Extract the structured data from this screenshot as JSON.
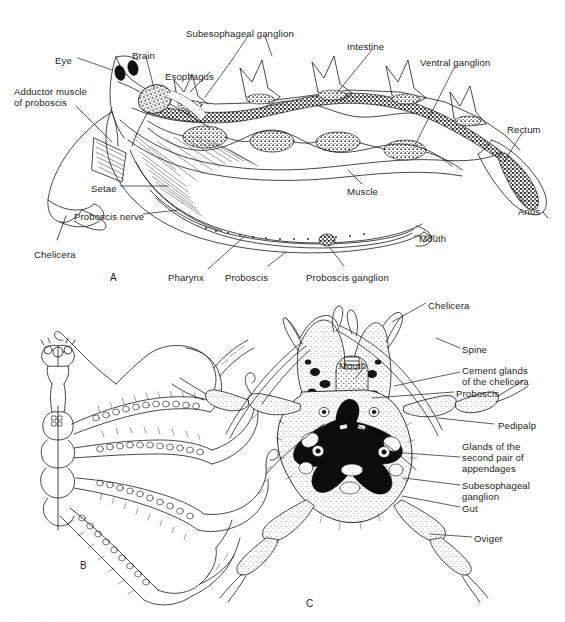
{
  "figure": {
    "background_color": "#ffffff",
    "ink_color": "#1a1a1a",
    "panel_letters": [
      {
        "id": "A",
        "label": "A",
        "x": 110,
        "y": 272
      },
      {
        "id": "B",
        "label": "B",
        "x": 80,
        "y": 560
      },
      {
        "id": "C",
        "label": "C",
        "x": 306,
        "y": 598
      }
    ],
    "bottom_cut_text": "....   ...    ......   ..........."
  },
  "panel_a": {
    "caption": "A",
    "description": "Lateral view, internal anatomy of the body and proboscis",
    "labels": [
      {
        "name": "eye",
        "text": "Eye",
        "x": 55,
        "y": 55,
        "align": "left"
      },
      {
        "name": "brain",
        "text": "Brain",
        "x": 132,
        "y": 50,
        "align": "left"
      },
      {
        "name": "subesophageal-ganglion",
        "text": "Subesophageal ganglion",
        "x": 186,
        "y": 28,
        "align": "left"
      },
      {
        "name": "intestine",
        "text": "Intestine",
        "x": 347,
        "y": 41,
        "align": "left"
      },
      {
        "name": "ventral-ganglion",
        "text": "Ventral ganglion",
        "x": 420,
        "y": 57,
        "align": "left"
      },
      {
        "name": "esophagus",
        "text": "Esophagus",
        "x": 165,
        "y": 71,
        "align": "left"
      },
      {
        "name": "adductor-muscle-of-proboscis",
        "text": "Adductor muscle\nof proboscis",
        "x": 14,
        "y": 86,
        "align": "left"
      },
      {
        "name": "rectum",
        "text": "Rectum",
        "x": 507,
        "y": 124,
        "align": "left"
      },
      {
        "name": "anus",
        "text": "Anus",
        "x": 518,
        "y": 206,
        "align": "left"
      },
      {
        "name": "muscle",
        "text": "Muscle",
        "x": 347,
        "y": 186,
        "align": "left"
      },
      {
        "name": "setae",
        "text": "Setae",
        "x": 91,
        "y": 183,
        "align": "left"
      },
      {
        "name": "proboscis-nerve",
        "text": "Proboscis nerve",
        "x": 74,
        "y": 211,
        "align": "left"
      },
      {
        "name": "chelicera",
        "text": "Chelicera",
        "x": 34,
        "y": 249,
        "align": "left"
      },
      {
        "name": "pharynx",
        "text": "Pharynx",
        "x": 168,
        "y": 272,
        "align": "left"
      },
      {
        "name": "proboscis",
        "text": "Proboscis",
        "x": 225,
        "y": 272,
        "align": "left"
      },
      {
        "name": "proboscis-ganglion",
        "text": "Proboscis ganglion",
        "x": 306,
        "y": 272,
        "align": "left"
      },
      {
        "name": "mouth",
        "text": "Mouth",
        "x": 419,
        "y": 233,
        "align": "left"
      }
    ]
  },
  "panel_b": {
    "caption": "B",
    "description": "Dorsal view of whole animal showing gut diverticula extending into the legs",
    "labels": []
  },
  "panel_c": {
    "caption": "C",
    "description": "Ventral view of the anterior body showing chelicerae, proboscis and appendages",
    "labels": [
      {
        "name": "chelicera",
        "text": "Chelicera",
        "x": 428,
        "y": 300,
        "align": "left"
      },
      {
        "name": "mouth",
        "text": "Mouth",
        "x": 339,
        "y": 360,
        "align": "left"
      },
      {
        "name": "spine",
        "text": "Spine",
        "x": 462,
        "y": 344,
        "align": "left"
      },
      {
        "name": "cement-glands-of-the-chelicera",
        "text": "Cement glands\nof the chelicera",
        "x": 462,
        "y": 365,
        "align": "left"
      },
      {
        "name": "proboscis",
        "text": "Proboscis",
        "x": 456,
        "y": 388,
        "align": "left"
      },
      {
        "name": "pedipalp",
        "text": "Pedipalp",
        "x": 498,
        "y": 420,
        "align": "left"
      },
      {
        "name": "glands-of-the-second-pair-of-appendages",
        "text": "Glands of the\nsecond pair of\nappendages",
        "x": 462,
        "y": 441,
        "align": "left"
      },
      {
        "name": "subesophageal-ganglion",
        "text": "Subesophageal\nganglion",
        "x": 462,
        "y": 480,
        "align": "left"
      },
      {
        "name": "gut",
        "text": "Gut",
        "x": 462,
        "y": 503,
        "align": "left"
      },
      {
        "name": "oviger",
        "text": "Oviger",
        "x": 474,
        "y": 533,
        "align": "left"
      }
    ]
  }
}
